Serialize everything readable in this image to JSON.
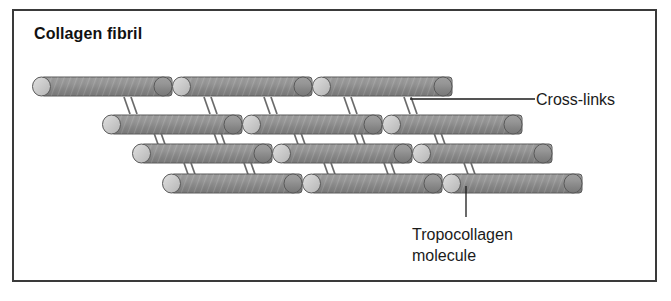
{
  "figure": {
    "title": "Collagen fibril",
    "border_color": "#3a3a3a",
    "background_color": "#ffffff"
  },
  "labels": {
    "crosslinks": "Cross-links",
    "tropocollagen_line1": "Tropocollagen",
    "tropocollagen_line2": "molecule"
  },
  "diagram": {
    "type": "schematic",
    "rod_fill_color": "#8c8c8c",
    "rod_cap_color": "#c9c9c9",
    "rod_stroke_color": "#555555",
    "crosslink_color": "#6e6e6e",
    "leader_line_color": "#1b1b1b",
    "row_count": 4,
    "rods_per_row": 3,
    "rod_length": 140,
    "rod_height": 19,
    "rows": [
      {
        "index": 1,
        "y": 66,
        "x_positions": [
          18,
          158,
          298
        ]
      },
      {
        "index": 2,
        "y": 104,
        "x_positions": [
          88,
          228,
          368
        ]
      },
      {
        "index": 3,
        "y": 133,
        "x_positions": [
          118,
          258,
          398
        ]
      },
      {
        "index": 4,
        "y": 163,
        "x_positions": [
          148,
          288,
          428
        ]
      }
    ],
    "crosslink_pair_offsets": [
      22,
      62,
      102
    ],
    "crosslink_description": "paired short parallel diagonal lines bridging adjacent rows"
  }
}
